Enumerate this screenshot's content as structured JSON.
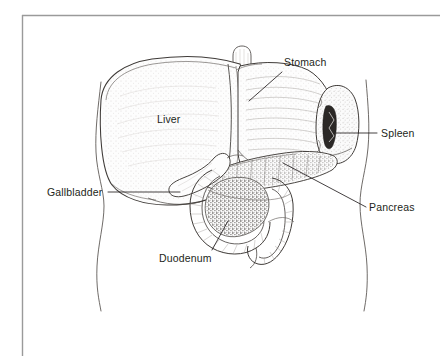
{
  "figure": {
    "type": "anatomical-illustration",
    "frame_color": "#9a9a9a",
    "line_color": "#3a3a3a",
    "text_color": "#231f20",
    "background_color": "#ffffff"
  },
  "labels": [
    {
      "id": "stomach",
      "text": "Stomach",
      "x": 284,
      "y": 56,
      "leader": {
        "x1": 282,
        "y1": 72,
        "x2": 249,
        "y2": 101
      }
    },
    {
      "id": "spleen",
      "text": "Spleen",
      "x": 381,
      "y": 128,
      "leader": {
        "x1": 377,
        "y1": 133,
        "x2": 336,
        "y2": 133
      }
    },
    {
      "id": "pancreas",
      "text": "Pancreas",
      "x": 369,
      "y": 202,
      "leader": {
        "x1": 366,
        "y1": 207,
        "x2": 283,
        "y2": 163
      }
    },
    {
      "id": "gallbladder",
      "text": "Gallbladder",
      "x": 47,
      "y": 186,
      "leader": {
        "x1": 108,
        "y1": 192,
        "x2": 180,
        "y2": 192
      }
    },
    {
      "id": "duodenum",
      "text": "Duodenum",
      "x": 159,
      "y": 252,
      "leader": {
        "x1": 212,
        "y1": 250,
        "x2": 228,
        "y2": 221
      }
    },
    {
      "id": "liver",
      "text": "Liver",
      "x": 157,
      "y": 113,
      "leader": null
    }
  ],
  "organs": [
    {
      "id": "liver",
      "name": "Liver"
    },
    {
      "id": "stomach",
      "name": "Stomach"
    },
    {
      "id": "spleen",
      "name": "Spleen"
    },
    {
      "id": "pancreas",
      "name": "Pancreas"
    },
    {
      "id": "gallbladder",
      "name": "Gallbladder"
    },
    {
      "id": "duodenum",
      "name": "Duodenum"
    },
    {
      "id": "esophagus",
      "name": "Esophagus"
    },
    {
      "id": "colon",
      "name": "Colon"
    },
    {
      "id": "torso",
      "name": "Torso outline"
    }
  ]
}
